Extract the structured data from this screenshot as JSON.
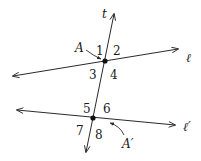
{
  "diagram": {
    "colors": {
      "stroke": "#2a2a2a",
      "text": "#1a1a1a",
      "background": "#ffffff"
    },
    "lines": [
      {
        "id": "t",
        "label": "t",
        "x1": 86,
        "y1": 152,
        "x2": 114,
        "y2": 14
      },
      {
        "id": "l",
        "label": "ℓ",
        "x1": 13,
        "y1": 76,
        "x2": 178,
        "y2": 49
      },
      {
        "id": "lprime",
        "label": "ℓ′",
        "x1": 17,
        "y1": 110,
        "x2": 175,
        "y2": 125
      }
    ],
    "points": [
      {
        "id": "A",
        "label": "A",
        "x": 105,
        "y": 61
      },
      {
        "id": "Aprime",
        "label": "A′",
        "x": 93,
        "y": 118
      }
    ],
    "angle_labels": [
      "1",
      "2",
      "3",
      "4",
      "5",
      "6",
      "7",
      "8"
    ]
  }
}
